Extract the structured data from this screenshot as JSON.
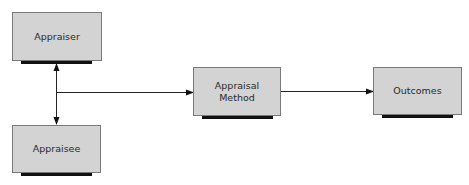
{
  "diagram": {
    "nodes": [
      {
        "id": "appraiser",
        "label": "Appraiser"
      },
      {
        "id": "appraisee",
        "label": "Appraisee"
      },
      {
        "id": "method",
        "label": "Appraisal\nMethod",
        "line1": "Appraisal",
        "line2": "Method"
      },
      {
        "id": "outcomes",
        "label": "Outcomes"
      }
    ],
    "edges": [
      {
        "from": "appraiser",
        "to": "appraisee",
        "type": "bidirectional"
      },
      {
        "from": "appraiser-appraisee",
        "to": "method",
        "type": "arrow"
      },
      {
        "from": "method",
        "to": "outcomes",
        "type": "arrow"
      }
    ]
  },
  "colors": {
    "box_fill": "#d3d3d3",
    "box_border": "#7a7a7a",
    "shadow": "#111111",
    "line": "#222222"
  }
}
